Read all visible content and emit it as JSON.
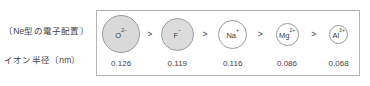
{
  "labels": {
    "electron_configuration": "〔Ne型の電子配置〕",
    "ionic_radius": "イオン半径〔nm〕"
  },
  "separator": ">",
  "chart_data": {
    "type": "diagram",
    "title": "",
    "xlabel": "",
    "ylabel": "イオン半径〔nm〕",
    "categories": [
      "O2-",
      "F-",
      "Na+",
      "Mg2+",
      "Al3+"
    ],
    "values": [
      0.126,
      0.119,
      0.116,
      0.086,
      0.068
    ],
    "unit": "nm",
    "order": "descending"
  },
  "ions": [
    {
      "symbol": "O",
      "charge": "2−",
      "value": "0.126",
      "diameter_px": 38,
      "fill": "#d9d9d9",
      "stroke": "#9a9a9a"
    },
    {
      "symbol": "F",
      "charge": "−",
      "value": "0.119",
      "diameter_px": 33,
      "fill": "#dcdcdc",
      "stroke": "#9a9a9a"
    },
    {
      "symbol": "Na",
      "charge": "+",
      "value": "0.116",
      "diameter_px": 29,
      "fill": "#ffffff",
      "stroke": "#9a9a9a"
    },
    {
      "symbol": "Mg",
      "charge": "2+",
      "value": "0.086",
      "diameter_px": 23,
      "fill": "#ffffff",
      "stroke": "#9a9a9a"
    },
    {
      "symbol": "Al",
      "charge": "3+",
      "value": "0.068",
      "diameter_px": 19,
      "fill": "#ffffff",
      "stroke": "#9a9a9a"
    }
  ],
  "colors": {
    "frame_border": "#b4b4b4",
    "text": "#3a3a3a",
    "shaded_fill": "#d9d9d9",
    "unshaded_fill": "#ffffff"
  }
}
